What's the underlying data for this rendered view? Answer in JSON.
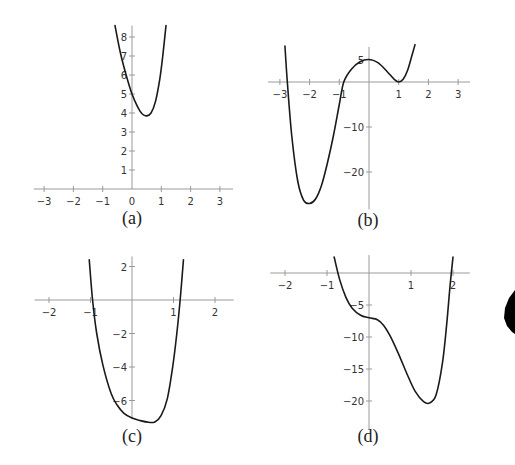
{
  "chart_data": [
    {
      "id": "a",
      "type": "line",
      "title": "(a)",
      "xlabel": "",
      "ylabel": "",
      "xlim": [
        -3.35,
        3.45
      ],
      "ylim": [
        0,
        8.6
      ],
      "grid": false,
      "xticks": [
        -3,
        -2,
        -1,
        0,
        1,
        2,
        3
      ],
      "xtick_labels": [
        "−3",
        "−2",
        "−1",
        "0",
        "1",
        "2",
        "3"
      ],
      "yticks": [
        1,
        2,
        3,
        4,
        5,
        6,
        7,
        8
      ],
      "ytick_labels": [
        "1",
        "2",
        "3",
        "4",
        "5",
        "6",
        "7",
        "8"
      ],
      "series": [
        {
          "name": "f_a",
          "x": [
            -0.58,
            -0.4,
            -0.2,
            0,
            0.2,
            0.35,
            0.5,
            0.65,
            0.8,
            0.95,
            1.05,
            1.16
          ],
          "y": [
            8.6,
            7.2,
            6.0,
            5.0,
            4.3,
            3.95,
            3.85,
            4.0,
            4.6,
            5.8,
            7.0,
            8.6
          ]
        }
      ],
      "annotations": [
        "minimum near (0.5, 3.85)"
      ]
    },
    {
      "id": "b",
      "type": "line",
      "title": "(b)",
      "xlabel": "",
      "ylabel": "",
      "xlim": [
        -3.4,
        3.4
      ],
      "ylim": [
        -28.5,
        8
      ],
      "grid": false,
      "xticks": [
        -3,
        -2,
        -1,
        1,
        2,
        3
      ],
      "xtick_labels": [
        "−3",
        "−2",
        "−1",
        "1",
        "2",
        "3"
      ],
      "yticks": [
        5,
        -10,
        -20
      ],
      "ytick_labels": [
        "5",
        "−10",
        "−20"
      ],
      "series": [
        {
          "name": "f_b",
          "x": [
            -2.83,
            -2.75,
            -2.6,
            -2.4,
            -2.2,
            -2.0,
            -1.8,
            -1.6,
            -1.4,
            -1.2,
            -1.0,
            -0.85,
            -0.6,
            -0.3,
            0,
            0.3,
            0.6,
            0.85,
            1.0,
            1.15,
            1.3,
            1.45,
            1.55
          ],
          "y": [
            8,
            0,
            -12,
            -22,
            -26.3,
            -27,
            -26,
            -23,
            -18,
            -12,
            -5,
            0,
            2.8,
            4.5,
            5,
            4.3,
            2.4,
            0.6,
            0,
            0.6,
            2.6,
            6,
            8.3
          ]
        }
      ],
      "annotations": [
        "local min near (-2, -27)",
        "local max at (0, 5)",
        "local min at (1, 0)"
      ]
    },
    {
      "id": "c",
      "type": "line",
      "title": "(c)",
      "xlabel": "",
      "ylabel": "",
      "xlim": [
        -2.35,
        2.45
      ],
      "ylim": [
        -7.1,
        2.6
      ],
      "grid": false,
      "xticks": [
        -2,
        -1,
        1,
        2
      ],
      "xtick_labels": [
        "−2",
        "−1",
        "1",
        "2"
      ],
      "yticks": [
        2,
        -2,
        -4,
        -6
      ],
      "ytick_labels": [
        "2",
        "−2",
        "−4",
        "−6"
      ],
      "series": [
        {
          "name": "f_c",
          "x": [
            -1.03,
            -0.95,
            -0.85,
            -0.7,
            -0.5,
            -0.35,
            -0.2,
            0,
            0.2,
            0.4,
            0.55,
            0.7,
            0.85,
            0.98,
            1.08,
            1.16,
            1.24
          ],
          "y": [
            2.4,
            0,
            -2,
            -3.9,
            -5.6,
            -6.3,
            -6.75,
            -7.05,
            -7.2,
            -7.3,
            -7.28,
            -6.9,
            -5.9,
            -4,
            -2,
            0,
            2.4
          ]
        }
      ],
      "annotations": [
        "minimum near (0.48, -7.3)"
      ]
    },
    {
      "id": "d",
      "type": "line",
      "title": "(d)",
      "xlabel": "",
      "ylabel": "",
      "xlim": [
        -2.35,
        2.4
      ],
      "ylim": [
        -24.5,
        4.5
      ],
      "grid": false,
      "xticks": [
        -2,
        -1,
        1,
        2
      ],
      "xtick_labels": [
        "−2",
        "−1",
        "1",
        "2"
      ],
      "yticks": [
        -5,
        -10,
        -15,
        -20
      ],
      "ytick_labels": [
        "−5",
        "−10",
        "−15",
        "−20"
      ],
      "series": [
        {
          "name": "f_d",
          "x": [
            -0.83,
            -0.7,
            -0.55,
            -0.4,
            -0.2,
            0,
            0.2,
            0.35,
            0.5,
            0.7,
            0.9,
            1.1,
            1.3,
            1.45,
            1.6,
            1.75,
            1.85,
            1.93,
            2.0
          ],
          "y": [
            2.5,
            -1,
            -3.8,
            -5.5,
            -6.6,
            -7,
            -7.3,
            -8.2,
            -9.8,
            -12.6,
            -15.7,
            -18.5,
            -20.1,
            -20.3,
            -19,
            -14,
            -8,
            -2,
            2.5
          ]
        }
      ],
      "annotations": [
        "plateau near (0, -7)",
        "minimum near (1.45, -20.3)"
      ]
    }
  ],
  "panels": [
    {
      "caption": "(a)",
      "px": {
        "x0": 132,
        "y0": 189,
        "sx": 29.3,
        "sy": 19,
        "ytop": 8.6,
        "ybot": 0,
        "caption_x": 132,
        "caption_y": 224
      }
    },
    {
      "caption": "(b)",
      "px": {
        "x0": 369,
        "y0": 82,
        "sx": 29.7,
        "sy": 4.5,
        "ytop": 7.8,
        "ybot": -28.3,
        "caption_x": 368,
        "caption_y": 226
      }
    },
    {
      "caption": "(c)",
      "px": {
        "x0": 132,
        "y0": 300,
        "sx": 41.5,
        "sy": 16.75,
        "ytop": 2.6,
        "ybot": -7.1,
        "caption_x": 132,
        "caption_y": 442
      }
    },
    {
      "caption": "(d)",
      "px": {
        "x0": 369,
        "y0": 273,
        "sx": 42,
        "sy": 6.4,
        "ytop": 2.8,
        "ybot": -24.5,
        "caption_x": 368,
        "caption_y": 442
      }
    }
  ]
}
